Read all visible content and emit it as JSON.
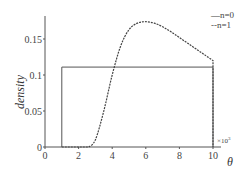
{
  "chart_data": {
    "type": "line",
    "title": "",
    "xlabel": "θ",
    "ylabel": "density",
    "x_multiplier": "×10³",
    "xlim": [
      0,
      10
    ],
    "ylim": [
      0,
      0.18
    ],
    "xticks": [
      0,
      2,
      4,
      6,
      8,
      10
    ],
    "xtick_labels": [
      "0",
      "2",
      "4",
      "6",
      "8",
      "10"
    ],
    "yticks": [
      0,
      0.05,
      0.1,
      0.15
    ],
    "ytick_labels": [
      "0",
      "0.05",
      "0.1",
      "0.15"
    ],
    "grid": false,
    "legend_position": "upper right",
    "series": [
      {
        "name": "n=0",
        "style": "solid",
        "x": [
          1,
          1,
          10,
          10
        ],
        "y": [
          0,
          0.111,
          0.111,
          0
        ]
      },
      {
        "name": "n=1",
        "style": "dashed",
        "x": [
          1,
          2.6,
          3.0,
          3.5,
          4.0,
          4.5,
          5.0,
          5.5,
          6.0,
          6.5,
          7.0,
          7.5,
          8.0,
          8.5,
          9.0,
          9.5,
          10.0,
          10.0
        ],
        "y": [
          0,
          0,
          0.01,
          0.05,
          0.1,
          0.14,
          0.163,
          0.172,
          0.174,
          0.172,
          0.167,
          0.16,
          0.152,
          0.144,
          0.136,
          0.128,
          0.12,
          0
        ]
      }
    ]
  },
  "legend": {
    "items": [
      {
        "marker": "—",
        "label": "n=0"
      },
      {
        "marker": "--",
        "label": "n=1"
      }
    ]
  },
  "axes": {
    "xlabel": "θ",
    "ylabel": "density",
    "x_multiplier_prefix": "×10",
    "x_multiplier_exp": "3"
  }
}
